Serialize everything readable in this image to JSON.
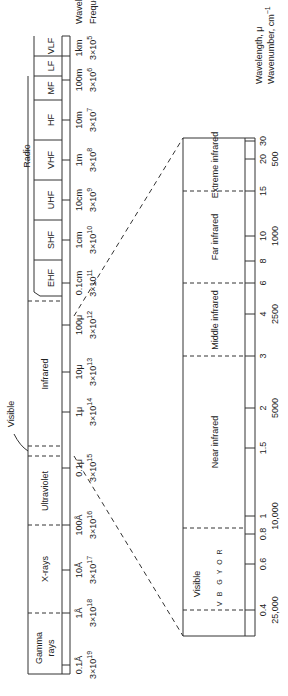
{
  "top_scale": {
    "axis_labels": {
      "wavelength": "Wavelength",
      "frequency": "Frequency, Hz"
    },
    "regions": [
      {
        "label": "Gamma",
        "label2": "rays"
      },
      {
        "label": "X-rays"
      },
      {
        "label": "Ultraviolet"
      },
      {
        "label": "Visible"
      },
      {
        "label": "Infrared"
      },
      {
        "label": "Radio"
      }
    ],
    "radio_bands": [
      "EHF",
      "SHF",
      "UHF",
      "VHF",
      "HF",
      "MF",
      "LF",
      "VLF"
    ],
    "ticks": [
      {
        "wavelength": "0.1Å",
        "frequency": "3×10",
        "exp": "19"
      },
      {
        "wavelength": "1Å",
        "frequency": "3×10",
        "exp": "18"
      },
      {
        "wavelength": "10Å",
        "frequency": "3×10",
        "exp": "17"
      },
      {
        "wavelength": "100Å",
        "frequency": "3×10",
        "exp": "16"
      },
      {
        "wavelength": "0.1μ",
        "frequency": "3×10",
        "exp": "15"
      },
      {
        "wavelength": "1μ",
        "frequency": "3×10",
        "exp": "14"
      },
      {
        "wavelength": "10μ",
        "frequency": "3×10",
        "exp": "13"
      },
      {
        "wavelength": "100μ",
        "frequency": "3×10",
        "exp": "12"
      },
      {
        "wavelength": "0.1cm",
        "frequency": "3×10",
        "exp": "11"
      },
      {
        "wavelength": "1cm",
        "frequency": "3×10",
        "exp": "10"
      },
      {
        "wavelength": "10cm",
        "frequency": "3×10",
        "exp": "9"
      },
      {
        "wavelength": "1m",
        "frequency": "3×10",
        "exp": "8"
      },
      {
        "wavelength": "10m",
        "frequency": "3×10",
        "exp": "7"
      },
      {
        "wavelength": "100m",
        "frequency": "3×10",
        "exp": "6"
      },
      {
        "wavelength": "1km",
        "frequency": "3×10",
        "exp": "5"
      },
      {
        "wavelength": "10km",
        "frequency": "3×10",
        "exp": "4"
      },
      {
        "wavelength": "100km",
        "frequency": "3×10",
        "exp": "3"
      }
    ]
  },
  "bottom_scale": {
    "axis_labels": {
      "wavelength": "Wavelength, μ",
      "wavenumber": "Wavenumber, cm",
      "wavenumber_exp": "−1"
    },
    "regions": [
      "Visible",
      "Near infrared",
      "Middle infrared",
      "Far infrared",
      "Extreme infrared"
    ],
    "visible_colors": [
      "V",
      "B",
      "G",
      "Y",
      "O",
      "R"
    ],
    "ticks": [
      {
        "wavelength": "0.4",
        "wavenumber": "25,000"
      },
      {
        "wavelength": "0.6",
        "wavenumber": ""
      },
      {
        "wavelength": "0.8",
        "wavenumber": ""
      },
      {
        "wavelength": "1",
        "wavenumber": "10,000"
      },
      {
        "wavelength": "1.5",
        "wavenumber": ""
      },
      {
        "wavelength": "2",
        "wavenumber": "5000"
      },
      {
        "wavelength": "3",
        "wavenumber": ""
      },
      {
        "wavelength": "4",
        "wavenumber": "2500"
      },
      {
        "wavelength": "6",
        "wavenumber": ""
      },
      {
        "wavelength": "8",
        "wavenumber": ""
      },
      {
        "wavelength": "10",
        "wavenumber": "1000"
      },
      {
        "wavelength": "15",
        "wavenumber": ""
      },
      {
        "wavelength": "20",
        "wavenumber": "500"
      },
      {
        "wavelength": "30",
        "wavenumber": ""
      }
    ]
  }
}
